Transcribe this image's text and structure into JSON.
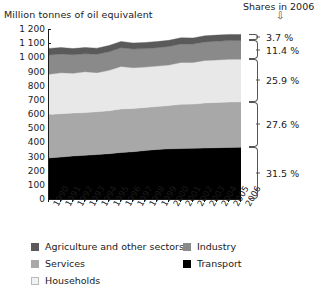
{
  "chart_data": {
    "type": "area",
    "title": "Million tonnes of oil equivalent",
    "xlabel": "",
    "ylabel": "Million tonnes of oil equivalent",
    "ylim": [
      0,
      1200
    ],
    "ytick_step": 100,
    "grid": false,
    "legend_position": "bottom",
    "stacked": true,
    "x": [
      1990,
      1991,
      1992,
      1993,
      1994,
      1995,
      1996,
      1997,
      1998,
      1999,
      2000,
      2001,
      2002,
      2003,
      2004,
      2005,
      2006
    ],
    "categories": [
      "1990",
      "1991",
      "1992",
      "1993",
      "1994",
      "1995",
      "1996",
      "1997",
      "1998",
      "1999",
      "2000",
      "2001",
      "2002",
      "2003",
      "2004",
      "2005",
      "2006"
    ],
    "ytick_labels": [
      "0",
      "100",
      "200",
      "300",
      "400",
      "500",
      "600",
      "700",
      "800",
      "900",
      "1 000",
      "1 100",
      "1 200"
    ],
    "series": [
      {
        "name": "Transport",
        "color": "#000000",
        "share_2006": "31.5 %",
        "values": [
          290,
          296,
          304,
          308,
          314,
          320,
          328,
          334,
          342,
          350,
          354,
          356,
          358,
          360,
          362,
          364,
          366
        ]
      },
      {
        "name": "Services",
        "color": "#a8a8a8",
        "share_2006": "27.6 %",
        "values": [
          307,
          306,
          303,
          302,
          302,
          303,
          308,
          305,
          304,
          303,
          306,
          312,
          312,
          318,
          320,
          320,
          320
        ]
      },
      {
        "name": "Households",
        "color": "#e8e8e8",
        "share_2006": "25.9 %",
        "values": [
          283,
          289,
          281,
          288,
          276,
          285,
          300,
          288,
          285,
          285,
          286,
          296,
          294,
          300,
          300,
          302,
          301
        ]
      },
      {
        "name": "Industry",
        "color": "#8a8a8a",
        "share_2006": "11.4 %",
        "values": [
          137,
          133,
          130,
          127,
          130,
          131,
          132,
          131,
          131,
          130,
          131,
          131,
          130,
          131,
          132,
          132,
          132
        ]
      },
      {
        "name": "Agriculture and other sectors",
        "color": "#5a5a5a",
        "share_2006": "3.7 %",
        "values": [
          46,
          45,
          44,
          44,
          43,
          44,
          44,
          43,
          43,
          43,
          43,
          43,
          43,
          43,
          43,
          43,
          43
        ]
      }
    ],
    "annotations": {
      "shares_header": "Shares in 2006",
      "shares_arrow": "⇩"
    }
  },
  "legend": {
    "items": [
      {
        "label": "Agriculture and other sectors",
        "color": "#5a5a5a",
        "outline": false
      },
      {
        "label": "Industry",
        "color": "#8a8a8a",
        "outline": false
      },
      {
        "label": "Services",
        "color": "#a8a8a8",
        "outline": false
      },
      {
        "label": "Transport",
        "color": "#000000",
        "outline": false
      },
      {
        "label": "Households",
        "color": "#f2f2f2",
        "outline": true
      }
    ]
  }
}
